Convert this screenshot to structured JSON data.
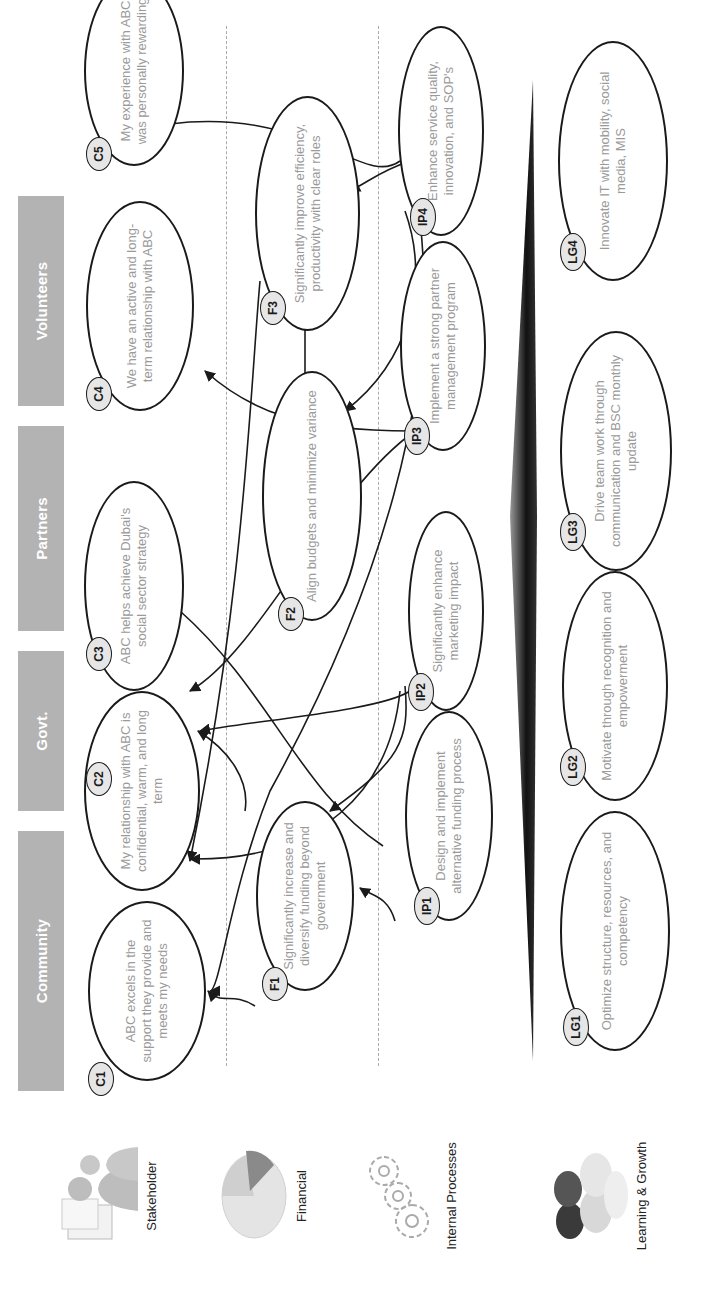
{
  "stakeholder_headers": [
    {
      "id": "community",
      "label": "Community"
    },
    {
      "id": "govt",
      "label": "Govt."
    },
    {
      "id": "partners",
      "label": "Partners"
    },
    {
      "id": "volunteers",
      "label": "Volunteers"
    }
  ],
  "perspectives": [
    {
      "id": "stakeholder",
      "label": "Stakeholder",
      "icon": "people-icon"
    },
    {
      "id": "financial",
      "label": "Financial",
      "icon": "pie-chart-icon"
    },
    {
      "id": "internal",
      "label": "Internal Processes",
      "icon": "gears-icon"
    },
    {
      "id": "learning",
      "label": "Learning & Growth",
      "icon": "puzzle-pieces-icon"
    }
  ],
  "objectives": {
    "C1": {
      "code": "C1",
      "text": "ABC excels in the support they provide and meets my needs"
    },
    "C2": {
      "code": "C2",
      "text": "My relationship with ABC is confidential, warm, and long term"
    },
    "C3": {
      "code": "C3",
      "text": "ABC helps achieve Dubai's social sector strategy"
    },
    "C4": {
      "code": "C4",
      "text": "We have an active and long-term relationship with ABC"
    },
    "C5": {
      "code": "C5",
      "text": "My experience with ABC was personally rewarding"
    },
    "F1": {
      "code": "F1",
      "text": "Significantly increase and diversify funding beyond government"
    },
    "F2": {
      "code": "F2",
      "text": "Align budgets and minimize variance"
    },
    "F3": {
      "code": "F3",
      "text": "Significantly improve efficiency, productivity with clear roles"
    },
    "IP1": {
      "code": "IP1",
      "text": "Design and implement alternative funding process"
    },
    "IP2": {
      "code": "IP2",
      "text": "Significantly enhance marketing impact"
    },
    "IP3": {
      "code": "IP3",
      "text": "Implement a strong partner management program"
    },
    "IP4": {
      "code": "IP4",
      "text": "Enhance service quality, innovation, and SOP's"
    },
    "LG1": {
      "code": "LG1",
      "text": "Optimize structure, resources, and competency"
    },
    "LG2": {
      "code": "LG2",
      "text": "Motivate through recognition and empowerment"
    },
    "LG3": {
      "code": "LG3",
      "text": "Drive team work through communication and BSC monthly update"
    },
    "LG4": {
      "code": "LG4",
      "text": "Innovate IT with mobility, social media, MIS"
    }
  },
  "links": [
    {
      "from": "F1",
      "to": "C1"
    },
    {
      "from": "F1",
      "to": "C3"
    },
    {
      "from": "IP1",
      "to": "F1"
    },
    {
      "from": "IP1",
      "to": "C4"
    },
    {
      "from": "IP2",
      "to": "F1"
    },
    {
      "from": "IP2",
      "to": "C2"
    },
    {
      "from": "IP2",
      "to": "C3"
    },
    {
      "from": "IP3",
      "to": "C4"
    },
    {
      "from": "IP3",
      "to": "C3"
    },
    {
      "from": "IP4",
      "to": "C5"
    },
    {
      "from": "IP4",
      "to": "F3"
    },
    {
      "from": "IP4",
      "to": "F2"
    },
    {
      "from": "IP4",
      "to": "C1"
    },
    {
      "from": "F2",
      "to": "F3"
    },
    {
      "from": "F3",
      "to": "C2"
    }
  ],
  "colors": {
    "header_bg": "#b3b3b3",
    "header_text": "#ffffff",
    "node_border": "#1a1a1a",
    "node_text": "#9a9a9a",
    "badge_bg": "#e6e6e6",
    "dash": "#aaaaaa",
    "divider": "#111111"
  }
}
